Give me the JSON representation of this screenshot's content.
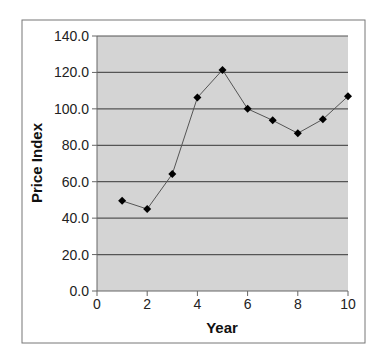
{
  "chart_data": {
    "type": "line",
    "title": "",
    "xlabel": "Year",
    "ylabel": "Price Index",
    "x": [
      1,
      2,
      3,
      4,
      5,
      6,
      7,
      8,
      9,
      10
    ],
    "series": [
      {
        "name": "Price Index",
        "values": [
          49.5,
          45.0,
          64.2,
          106.2,
          121.4,
          100.0,
          93.7,
          86.6,
          94.3,
          106.9
        ],
        "marker": "diamond",
        "color": "#000000",
        "line_color": "#555555"
      }
    ],
    "xlim": [
      0,
      10
    ],
    "ylim": [
      0,
      140
    ],
    "x_ticks": [
      0,
      2,
      4,
      6,
      8,
      10
    ],
    "y_ticks": [
      0,
      20,
      40,
      60,
      80,
      100,
      120,
      140
    ],
    "x_tick_labels": [
      "0",
      "2",
      "4",
      "6",
      "8",
      "10"
    ],
    "y_tick_labels": [
      "0.0",
      "20.0",
      "40.0",
      "60.0",
      "80.0",
      "100.0",
      "120.0",
      "140.0"
    ],
    "grid": {
      "horizontal": true,
      "vertical": false
    },
    "legend": null,
    "plot_background": "#d4d4d4",
    "gridline_color": "#555555"
  }
}
